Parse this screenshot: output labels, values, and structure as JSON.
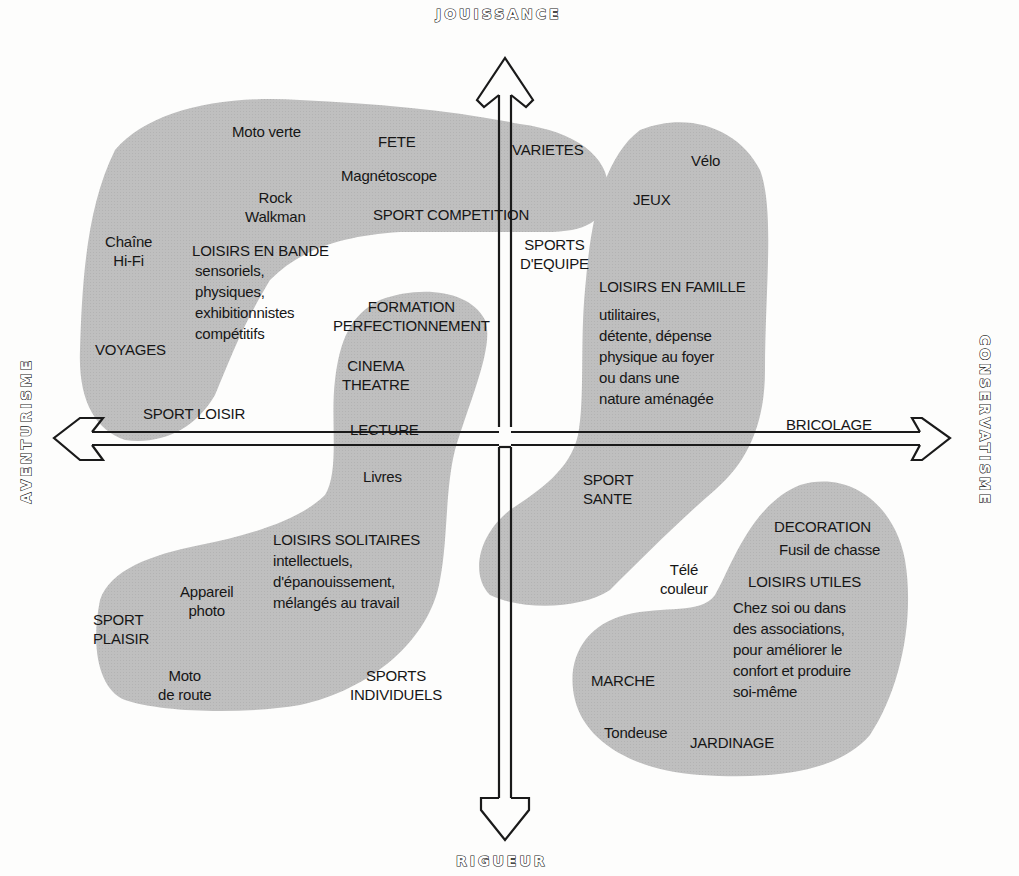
{
  "axes": {
    "top": "JOUISSANCE",
    "bottom": "RIGUEUR",
    "left": "AVENTURISME",
    "right": "CONSERVATISME"
  },
  "colors": {
    "blob_fill": "#bdbdbd",
    "background": "#fdfdfc",
    "text": "#161616",
    "arrow_stroke": "#1a1a1a"
  },
  "clusters": {
    "loisirs_en_bande": {
      "title": "LOISIRS EN BANDE",
      "desc": [
        "sensoriels,",
        "physiques,",
        "exhibitionnistes",
        "compétitifs"
      ],
      "items": {
        "moto_verte": "Moto verte",
        "fete": "FETE",
        "varietes": "VARIETES",
        "magnetoscope": "Magnétoscope",
        "rock": "Rock",
        "walkman": "Walkman",
        "sport_competition": "SPORT COMPETITION",
        "chaine": "Chaîne",
        "hifi": "Hi-Fi",
        "voyages": "VOYAGES",
        "sport_loisir": "SPORT LOISIR"
      }
    },
    "loisirs_en_famille": {
      "title": "LOISIRS EN FAMILLE",
      "desc": [
        "utilitaires,",
        "détente, dépense",
        "physique au foyer",
        "ou dans une",
        "nature aménagée"
      ],
      "items": {
        "velo": "Vélo",
        "jeux": "JEUX",
        "sports_equipe_1": "SPORTS",
        "sports_equipe_2": "D'EQUIPE",
        "sport_sante_1": "SPORT",
        "sport_sante_2": "SANTE"
      }
    },
    "loisirs_solitaires": {
      "title": "LOISIRS SOLITAIRES",
      "desc": [
        "intellectuels,",
        "d'épanouissement,",
        "mélangés au travail"
      ],
      "items": {
        "formation": "FORMATION",
        "perfectionnement": "PERFECTIONNEMENT",
        "cinema": "CINEMA",
        "theatre": "THEATRE",
        "lecture": "LECTURE",
        "livres": "Livres",
        "appareil": "Appareil",
        "photo": "photo",
        "sport_plaisir_1": "SPORT",
        "sport_plaisir_2": "PLAISIR",
        "moto_route_1": "Moto",
        "moto_route_2": "de route",
        "sports_indiv_1": "SPORTS",
        "sports_indiv_2": "INDIVIDUELS"
      }
    },
    "loisirs_utiles": {
      "title": "LOISIRS UTILES",
      "desc": [
        "Chez soi ou dans",
        "des associations,",
        "pour améliorer le",
        "confort et produire",
        "soi-même"
      ],
      "items": {
        "bricolage": "BRICOLAGE",
        "decoration": "DECORATION",
        "fusil": "Fusil de chasse",
        "tele_1": "Télé",
        "tele_2": "couleur",
        "marche": "MARCHE",
        "tondeuse": "Tondeuse",
        "jardinage": "JARDINAGE"
      }
    }
  }
}
